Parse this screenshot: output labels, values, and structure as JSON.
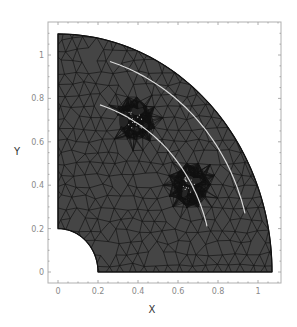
{
  "chart_data": {
    "type": "mesh",
    "title": "",
    "xlabel": "X",
    "ylabel": "Y",
    "xlim": [
      0,
      1.1
    ],
    "ylim": [
      0,
      1.1
    ],
    "x_ticks": [
      {
        "value": 0,
        "label": "0"
      },
      {
        "value": 0.2,
        "label": "0.2"
      },
      {
        "value": 0.4,
        "label": "0.4"
      },
      {
        "value": 0.6,
        "label": "0.6"
      },
      {
        "value": 0.8,
        "label": "0.8"
      },
      {
        "value": 1.0,
        "label": "1"
      }
    ],
    "y_ticks": [
      {
        "value": 0,
        "label": "0"
      },
      {
        "value": 0.2,
        "label": "0.2"
      },
      {
        "value": 0.4,
        "label": "0.4"
      },
      {
        "value": 0.6,
        "label": "0.6"
      },
      {
        "value": 0.8,
        "label": "0.8"
      },
      {
        "value": 1.0,
        "label": "1"
      }
    ],
    "grid": false,
    "legend": "none",
    "domain_geometry": {
      "shape": "quarter annulus with rectangular corner",
      "outer_radius": 1.07,
      "hole_radius": 0.2,
      "center": [
        0,
        0
      ]
    },
    "cracks": [
      {
        "name": "inner-crack",
        "start": [
          0.21,
          0.77
        ],
        "end": [
          0.745,
          0.21
        ]
      },
      {
        "name": "outer-crack",
        "start": [
          0.26,
          0.97
        ],
        "end": [
          0.935,
          0.27
        ]
      }
    ],
    "refinement_zones": [
      {
        "center": [
          0.385,
          0.7
        ]
      },
      {
        "center": [
          0.66,
          0.4
        ]
      }
    ],
    "colors": {
      "mesh_fill": "#454545",
      "mesh_edges": "#111111",
      "crack_lines": "#d8d8d8",
      "frame": "#aaaaaa"
    }
  }
}
